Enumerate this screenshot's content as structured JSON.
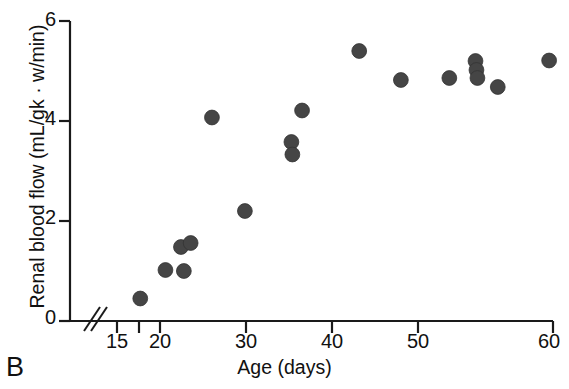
{
  "panel": {
    "label": "B"
  },
  "axes": {
    "x": {
      "title": "Age (days)",
      "tick_labels": [
        "15",
        "20",
        "30",
        "40",
        "50",
        "60"
      ],
      "tick_values": [
        15,
        20,
        30,
        40,
        50,
        60
      ],
      "minor_tick_values": [
        17.5
      ],
      "range": [
        14,
        60
      ],
      "broken": true,
      "break_symbol": "//"
    },
    "y": {
      "title": "Renal blood flow (mL/gk · w/min)",
      "tick_labels": [
        "0",
        "2",
        "4",
        "6"
      ],
      "tick_values": [
        0,
        2,
        4,
        6
      ],
      "range": [
        0,
        6
      ]
    }
  },
  "style": {
    "marker_color": "#454545",
    "axis_color": "#1a1a1a",
    "background": "#ffffff"
  },
  "chart_data": {
    "type": "scatter",
    "title": "",
    "subtitle": "",
    "xlabel": "Age (days)",
    "ylabel": "Renal blood flow (mL/gk · w/min)",
    "xlim": [
      14,
      60
    ],
    "ylim": [
      0,
      6
    ],
    "xticks": [
      15,
      20,
      30,
      40,
      50,
      60
    ],
    "yticks": [
      0,
      2,
      4,
      6
    ],
    "grid": false,
    "legend": null,
    "axis_break_x": true,
    "marker": "filled-circle",
    "marker_color": "#454545",
    "n_points": 17,
    "points": [
      {
        "x": 17.4,
        "y": 0.45
      },
      {
        "x": 20.0,
        "y": 1.02
      },
      {
        "x": 21.9,
        "y": 1.0
      },
      {
        "x": 21.6,
        "y": 1.48
      },
      {
        "x": 22.6,
        "y": 1.56
      },
      {
        "x": 24.8,
        "y": 4.07
      },
      {
        "x": 28.2,
        "y": 2.2
      },
      {
        "x": 33.0,
        "y": 3.58
      },
      {
        "x": 33.1,
        "y": 3.33
      },
      {
        "x": 34.1,
        "y": 4.21
      },
      {
        "x": 40.0,
        "y": 5.4
      },
      {
        "x": 44.3,
        "y": 4.82
      },
      {
        "x": 49.3,
        "y": 4.86
      },
      {
        "x": 52.0,
        "y": 5.2
      },
      {
        "x": 52.1,
        "y": 5.02
      },
      {
        "x": 52.2,
        "y": 4.86
      },
      {
        "x": 54.3,
        "y": 4.68
      },
      {
        "x": 59.6,
        "y": 5.21
      }
    ],
    "series": [
      {
        "name": "Renal blood flow",
        "x": [
          17.4,
          20.0,
          21.9,
          21.6,
          22.6,
          24.8,
          28.2,
          33.0,
          33.1,
          34.1,
          40.0,
          44.3,
          49.3,
          52.0,
          52.1,
          52.2,
          54.3,
          59.6
        ],
        "y": [
          0.45,
          1.02,
          1.0,
          1.48,
          1.56,
          4.07,
          2.2,
          3.58,
          3.33,
          4.21,
          5.4,
          4.82,
          4.86,
          5.2,
          5.02,
          4.86,
          4.68,
          5.21
        ]
      }
    ]
  }
}
